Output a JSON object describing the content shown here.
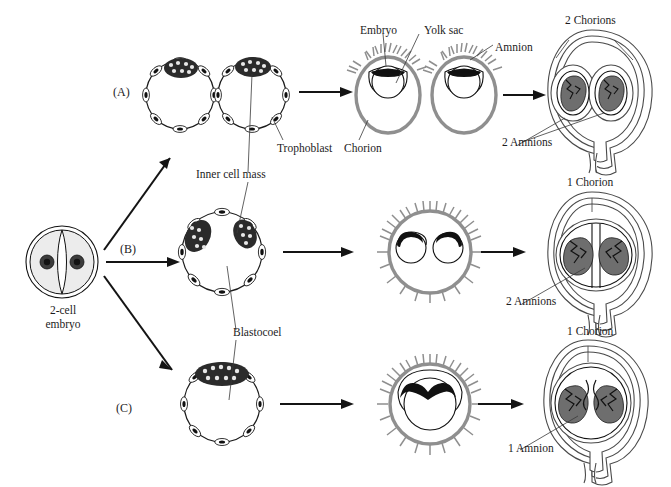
{
  "figure": {
    "background_color": "#ffffff",
    "ink_color": "#1a1a1a",
    "chorion_color": "#8f8f8f",
    "fetus_color": "#6e6e6e"
  },
  "start": {
    "label_line1": "2-cell",
    "label_line2": "embryo",
    "name": "2-cell embryo"
  },
  "pathways": [
    {
      "id": "A",
      "label": "(A)",
      "chorions": "2 Chorions",
      "amnions": "2 Amnions"
    },
    {
      "id": "B",
      "label": "(B)",
      "chorions": "1 Chorion",
      "amnions": "2 Amnions"
    },
    {
      "id": "C",
      "label": "(C)",
      "chorions": "1 Chorion",
      "amnions": "1 Amnion"
    }
  ],
  "annotations": {
    "embryo": "Embryo",
    "yolk_sac": "Yolk sac",
    "amnion": "Amnion",
    "trophoblast": "Trophoblast",
    "chorion": "Chorion",
    "inner_cell_mass": "Inner cell mass",
    "blastocoel": "Blastocoel"
  },
  "icons": {
    "arrow": "arrow-right-icon",
    "leader": "leader-line-icon"
  }
}
